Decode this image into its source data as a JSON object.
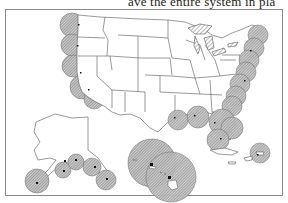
{
  "document": {
    "caption_fragment": "ave the entire system in pla"
  },
  "figure": {
    "type": "coverage-map",
    "regions": [
      "Contiguous United States",
      "Alaska",
      "Hawaii",
      "Puerto Rico"
    ],
    "symbol": "hatched circle",
    "colors": {
      "outline": "#555555",
      "hatch": "#7a7a7a",
      "fill": "#c8c8c8",
      "site": "#111111",
      "frame": "#8a8a8a"
    }
  }
}
